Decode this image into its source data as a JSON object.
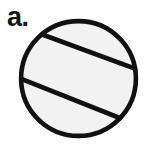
{
  "figure": {
    "panel_label": "a.",
    "caption_text": "",
    "background_color": "#ffffff",
    "width": 147,
    "height": 149
  },
  "diagram": {
    "type": "circle-with-two-parallel-chords",
    "stroke_color": "#111111",
    "fill_color": "#f2f2f2",
    "circle": {
      "center_x": 78.5,
      "center_y": 78.5,
      "radius": 59.5,
      "stroke_width": 4.6
    },
    "chords": [
      {
        "name": "upper-chord",
        "x1": 36.5,
        "y1": 32.5,
        "x2": 136.0,
        "y2": 69.0,
        "stroke_width": 4.6
      },
      {
        "name": "lower-chord",
        "x1": 20.5,
        "y1": 78.5,
        "x2": 120.0,
        "y2": 118.0,
        "stroke_width": 4.6
      }
    ]
  }
}
